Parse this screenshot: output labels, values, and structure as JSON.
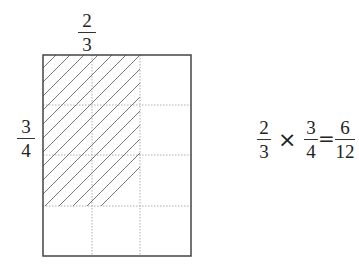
{
  "diagram": {
    "top_label": {
      "numerator": "2",
      "denominator": "3"
    },
    "side_label": {
      "numerator": "3",
      "denominator": "4"
    },
    "grid": {
      "columns": 3,
      "rows": 4,
      "shaded_columns": 2,
      "shaded_rows": 3,
      "border_color": "#444444",
      "divider_color": "#999999",
      "hatch_color": "#555555"
    }
  },
  "equation": {
    "left": {
      "numerator": "2",
      "denominator": "3"
    },
    "operator": "×",
    "right": {
      "numerator": "3",
      "denominator": "4"
    },
    "equals": "=",
    "result": {
      "numerator": "6",
      "denominator": "12"
    }
  }
}
